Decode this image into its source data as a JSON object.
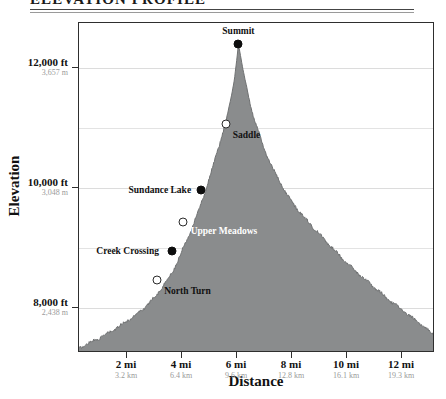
{
  "header": {
    "title": "ELEVATION PROFILE"
  },
  "chart_data": {
    "type": "area",
    "title": "ELEVATION PROFILE",
    "xlabel": "Distance",
    "ylabel": "Elevation",
    "xlim": [
      0.25,
      13.2
    ],
    "ylim": [
      7250,
      12750
    ],
    "grid": true,
    "legend": "none",
    "fill_color": "#8a8c8d",
    "line_color": "#6f7172",
    "x_ticks": [
      {
        "value": 2,
        "label": "2 mi",
        "sublabel": "3.2 km"
      },
      {
        "value": 4,
        "label": "4 mi",
        "sublabel": "6.4 km"
      },
      {
        "value": 6,
        "label": "6 mi",
        "sublabel": "9.6 km"
      },
      {
        "value": 8,
        "label": "8 mi",
        "sublabel": "12.8 km"
      },
      {
        "value": 10,
        "label": "10 mi",
        "sublabel": "16.1 km"
      },
      {
        "value": 12,
        "label": "12 mi",
        "sublabel": "19.3 km"
      }
    ],
    "y_ticks": [
      {
        "value": 12000,
        "label": "12,000 ft",
        "sublabel": "3,657 m"
      },
      {
        "value": 10000,
        "label": "10,000 ft",
        "sublabel": "3,048 m"
      },
      {
        "value": 8000,
        "label": "8,000 ft",
        "sublabel": "2,438 m"
      }
    ],
    "y_gridlines": [
      12000,
      11000,
      10000,
      9000,
      8000
    ],
    "x": [
      0.25,
      0.55,
      0.9,
      1.25,
      1.6,
      1.95,
      2.3,
      2.65,
      3.0,
      3.3,
      3.6,
      3.85,
      4.1,
      4.35,
      4.6,
      4.8,
      5.0,
      5.2,
      5.4,
      5.6,
      5.75,
      5.9,
      6.0,
      6.05,
      6.2,
      6.4,
      6.6,
      6.85,
      7.1,
      7.4,
      7.7,
      8.0,
      8.35,
      8.7,
      9.05,
      9.4,
      9.75,
      10.1,
      10.5,
      10.9,
      11.3,
      11.7,
      12.1,
      12.5,
      12.9,
      13.2
    ],
    "y": [
      7330,
      7400,
      7480,
      7560,
      7660,
      7770,
      7880,
      8010,
      8180,
      8360,
      8560,
      8790,
      9060,
      9330,
      9620,
      9880,
      10180,
      10480,
      10790,
      11120,
      11420,
      11800,
      12180,
      12400,
      12010,
      11560,
      11180,
      10830,
      10520,
      10230,
      9980,
      9760,
      9560,
      9380,
      9200,
      9030,
      8870,
      8700,
      8540,
      8380,
      8220,
      8070,
      7930,
      7790,
      7650,
      7540
    ],
    "points": [
      {
        "name": "Summit",
        "x": 6.05,
        "y": 12400,
        "marker": "filled",
        "label_pos": "above"
      },
      {
        "name": "Saddle",
        "x": 5.58,
        "y": 11060,
        "marker": "hollow",
        "label_pos": "below-right"
      },
      {
        "name": "Sundance Lake",
        "x": 4.7,
        "y": 9960,
        "marker": "filled",
        "label_pos": "left"
      },
      {
        "name": "Upper Meadows",
        "x": 4.05,
        "y": 9430,
        "marker": "hollow",
        "label_pos": "right-light"
      },
      {
        "name": "Creek Crossing",
        "x": 3.62,
        "y": 8950,
        "marker": "filled",
        "label_pos": "left"
      },
      {
        "name": "North Turn",
        "x": 3.07,
        "y": 8470,
        "marker": "hollow",
        "label_pos": "below-right"
      }
    ]
  }
}
